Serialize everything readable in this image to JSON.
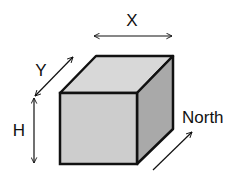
{
  "diagram": {
    "labels": {
      "x": "X",
      "y": "Y",
      "h": "H",
      "north": "North"
    },
    "colors": {
      "background": "#ffffff",
      "top_face": "#d8d8d8",
      "front_face": "#cdcdcd",
      "side_face": "#a9a9a9",
      "stroke": "#111111"
    }
  }
}
